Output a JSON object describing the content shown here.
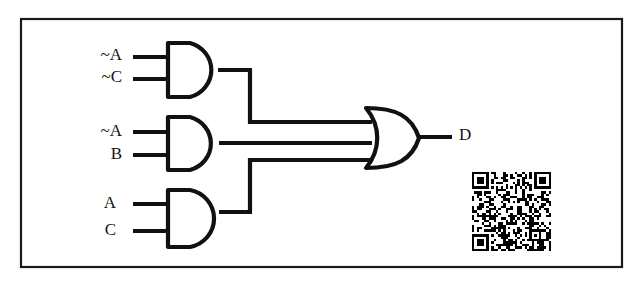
{
  "diagram": {
    "type": "logic-circuit",
    "background_color": "#ffffff",
    "line_color": "#111111",
    "frame": {
      "present": true,
      "color": "#1a1a1a",
      "x": 20,
      "y": 18,
      "width": 603,
      "height": 250
    },
    "gates": [
      {
        "id": "and1",
        "type": "AND",
        "inputs": [
          "~A",
          "~C"
        ],
        "output_label": "",
        "x": 166,
        "y": 41,
        "width": 47,
        "height": 58,
        "output_y": 70
      },
      {
        "id": "and2",
        "type": "AND",
        "inputs": [
          "~A",
          "B"
        ],
        "output_label": "",
        "x": 166,
        "y": 115,
        "width": 47,
        "height": 57,
        "output_y": 143
      },
      {
        "id": "and3",
        "type": "AND",
        "inputs": [
          "A",
          "C"
        ],
        "output_label": "",
        "x": 166,
        "y": 188,
        "width": 47,
        "height": 60,
        "output_y": 212
      },
      {
        "id": "or1",
        "type": "OR",
        "inputs": [
          "and1",
          "and2",
          "and3"
        ],
        "output_label": "D",
        "x": 365,
        "y": 106,
        "width": 56,
        "height": 64,
        "output_y": 137
      }
    ],
    "input_labels": [
      {
        "text": "~A",
        "gate": "and1",
        "pin": 0,
        "x": 122,
        "y": 56
      },
      {
        "text": "~C",
        "gate": "and1",
        "pin": 1,
        "x": 122,
        "y": 78
      },
      {
        "text": "~A",
        "gate": "and2",
        "pin": 0,
        "x": 122,
        "y": 132
      },
      {
        "text": "B",
        "gate": "and2",
        "pin": 1,
        "x": 122,
        "y": 155
      },
      {
        "text": "A",
        "gate": "and3",
        "pin": 0,
        "x": 115,
        "y": 204
      },
      {
        "text": "C",
        "gate": "and3",
        "pin": 1,
        "x": 115,
        "y": 231
      }
    ],
    "output_labels": [
      {
        "text": "D",
        "gate": "or1",
        "x": 458,
        "y": 136
      }
    ],
    "expression": "D = (~A & ~C) | (~A & B) | (A & C)",
    "qr_code": {
      "present": true,
      "x": 472,
      "y": 172,
      "size": 79
    }
  }
}
